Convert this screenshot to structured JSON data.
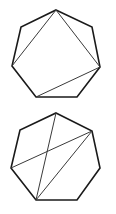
{
  "figure": {
    "width": 116,
    "height": 214,
    "colors": {
      "outline": "#1a1a1a",
      "diagonal": "#3a3a3a",
      "background": "#ffffff"
    },
    "heptagons": [
      {
        "id": "top",
        "vertices": [
          [
            56,
            10
          ],
          [
            92,
            27
          ],
          [
            100,
            67
          ],
          [
            77,
            97
          ],
          [
            36,
            97
          ],
          [
            12,
            66
          ],
          [
            21,
            27
          ]
        ],
        "diagonals": [
          [
            [
              56,
              10
            ],
            [
              12,
              66
            ]
          ],
          [
            [
              56,
              10
            ],
            [
              100,
              67
            ]
          ],
          [
            [
              100,
              67
            ],
            [
              36,
              97
            ]
          ]
        ]
      },
      {
        "id": "bottom",
        "vertices": [
          [
            56,
            113
          ],
          [
            92,
            131
          ],
          [
            100,
            168
          ],
          [
            77,
            200
          ],
          [
            36,
            200
          ],
          [
            11,
            168
          ],
          [
            20,
            130
          ]
        ],
        "diagonals": [
          [
            [
              56,
              113
            ],
            [
              36,
              200
            ]
          ],
          [
            [
              92,
              131
            ],
            [
              11,
              168
            ]
          ],
          [
            [
              92,
              131
            ],
            [
              36,
              200
            ]
          ]
        ]
      }
    ]
  }
}
